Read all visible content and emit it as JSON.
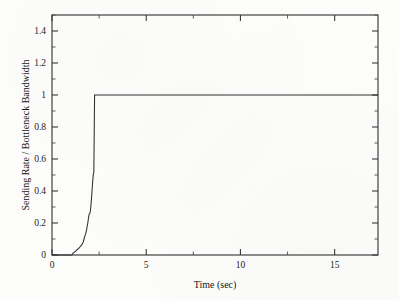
{
  "figure": {
    "background_color": "#fdfdfc",
    "ink_color": "#2e2e2e"
  },
  "chart_data": {
    "type": "line",
    "title": "",
    "xlabel": "Time (sec)",
    "ylabel": "Sending Rate / Bottleneck Bandwidth",
    "xlim": [
      0,
      17.3
    ],
    "ylim": [
      0,
      1.5
    ],
    "grid": false,
    "legend": null,
    "xticks": [
      0,
      5,
      10,
      15
    ],
    "xtick_labels": [
      "0",
      "5",
      "10",
      "15"
    ],
    "xminor_ticks": [
      2.5,
      7.5,
      12.5
    ],
    "yticks": [
      0,
      0.2,
      0.4,
      0.6,
      0.8,
      1,
      1.2,
      1.4
    ],
    "ytick_labels": [
      "0",
      "0.2",
      "0.4",
      "0.6",
      "0.8",
      "1",
      "1.2",
      "1.4"
    ],
    "yminor_ticks": [
      0.1,
      0.3,
      0.5,
      0.7,
      0.9,
      1.1,
      1.3,
      1.5
    ],
    "series": [
      {
        "name": "Sending rate ratio",
        "color": "#2e2e2e",
        "x": [
          0.0,
          1.05,
          1.12,
          1.18,
          1.24,
          1.3,
          1.36,
          1.42,
          1.48,
          1.54,
          1.6,
          1.66,
          1.7,
          1.74,
          1.78,
          1.82,
          1.86,
          1.9,
          1.94,
          1.98,
          2.02,
          2.06,
          2.1,
          2.14,
          2.18,
          2.2,
          2.22,
          2.26,
          3.0,
          5.0,
          7.0,
          9.0,
          11.0,
          13.0,
          15.0,
          17.3
        ],
        "y": [
          0.0,
          0.0,
          0.012,
          0.018,
          0.022,
          0.03,
          0.036,
          0.042,
          0.05,
          0.058,
          0.068,
          0.082,
          0.1,
          0.118,
          0.13,
          0.148,
          0.175,
          0.2,
          0.235,
          0.258,
          0.262,
          0.3,
          0.36,
          0.43,
          0.49,
          0.51,
          0.515,
          1.0,
          1.0,
          1.0,
          1.0,
          1.0,
          1.0,
          1.0,
          1.0,
          1.0
        ]
      }
    ],
    "annotations": []
  }
}
